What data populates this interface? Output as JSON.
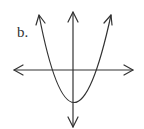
{
  "figure": {
    "label": "b.",
    "colors": {
      "stroke": "#333333",
      "background": "#ffffff"
    },
    "axes": {
      "x_axis_arrows": "both",
      "y_axis_arrows": "both"
    },
    "curve": {
      "type": "parabola",
      "opens": "up",
      "vertex": "below origin on y-axis",
      "x_intercepts": 2
    }
  }
}
